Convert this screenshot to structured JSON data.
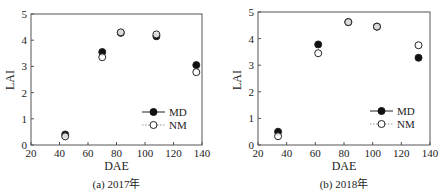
{
  "chart_data": [
    {
      "type": "scatter",
      "caption": "(a) 2017年",
      "xlabel": "DAE",
      "ylabel": "LAI",
      "xlim": [
        20,
        140
      ],
      "ylim": [
        0,
        5
      ],
      "xticks": [
        "20",
        "40",
        "60",
        "80",
        "100",
        "120",
        "140"
      ],
      "yticks": [
        "0",
        "1",
        "2",
        "3",
        "4",
        "5"
      ],
      "grid": false,
      "legend": "bottom-right",
      "series": [
        {
          "name": "MD",
          "marker": "filled-circle",
          "x": [
            44,
            70,
            83,
            108,
            136
          ],
          "y": [
            0.4,
            3.55,
            4.28,
            4.15,
            3.05
          ]
        },
        {
          "name": "NM",
          "marker": "open-circle",
          "x": [
            44,
            70,
            83,
            108,
            136
          ],
          "y": [
            0.33,
            3.35,
            4.3,
            4.22,
            2.78
          ]
        }
      ]
    },
    {
      "type": "scatter",
      "caption": "(b) 2018年",
      "xlabel": "DAE",
      "ylabel": "LAI",
      "xlim": [
        20,
        140
      ],
      "ylim": [
        0,
        5
      ],
      "xticks": [
        "20",
        "40",
        "60",
        "80",
        "100",
        "120",
        "140"
      ],
      "yticks": [
        "0",
        "1",
        "2",
        "3",
        "4",
        "5"
      ],
      "grid": false,
      "legend": "bottom-right",
      "series": [
        {
          "name": "MD",
          "marker": "filled-circle",
          "x": [
            34,
            62,
            83,
            103,
            132
          ],
          "y": [
            0.5,
            3.78,
            4.62,
            4.45,
            3.28
          ]
        },
        {
          "name": "NM",
          "marker": "open-circle",
          "x": [
            34,
            62,
            83,
            103,
            132
          ],
          "y": [
            0.33,
            3.45,
            4.62,
            4.45,
            3.75
          ]
        }
      ]
    }
  ]
}
